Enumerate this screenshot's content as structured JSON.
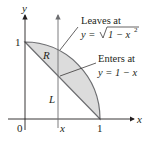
{
  "diagram": {
    "axes": {
      "x_label": "x",
      "y_label": "y",
      "origin_label": "0",
      "x_tick_label": "1",
      "y_tick_label": "1",
      "vertical_line_label": "x"
    },
    "region_label": "R",
    "line_label": "L",
    "annotations": [
      {
        "title": "Leaves at",
        "equation": "y = √1 − x²",
        "eq_prefix": "y = ",
        "eq_radicand": "1 − x",
        "eq_exp": "2"
      },
      {
        "title": "Enters at",
        "equation": "y = 1 − x",
        "eq_prefix": "y = 1 − x"
      }
    ],
    "colors": {
      "region_fill": "#dcdcdc",
      "stroke": "#6d6e71",
      "axis": "#231f20"
    }
  }
}
